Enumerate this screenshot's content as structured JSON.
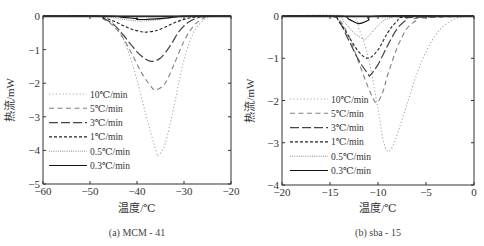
{
  "chart_data": [
    {
      "id": "a",
      "type": "line",
      "caption": "(a) MCM - 41",
      "xlabel": "温度/℃",
      "ylabel": "热流/mW",
      "xlim": [
        -60,
        -20
      ],
      "ylim": [
        -5,
        0
      ],
      "xticks": [
        -60,
        -50,
        -40,
        -30,
        -20
      ],
      "yticks": [
        0,
        -1,
        -2,
        -3,
        -4,
        -5
      ],
      "grid": false,
      "legend_position": "left-middle",
      "series": [
        {
          "name": "10℃/min",
          "style": "dotted-light",
          "peak_x": -35.5,
          "peak_y": -4.15,
          "onset_x": -47,
          "end_x": -24,
          "x": [
            -60,
            -48,
            -46,
            -44,
            -42,
            -40,
            -38,
            -36,
            -35.5,
            -34,
            -32,
            -30,
            -28,
            -26,
            -24,
            -20
          ],
          "y": [
            0,
            0,
            -0.1,
            -0.4,
            -1.0,
            -1.9,
            -3.0,
            -4.0,
            -4.15,
            -3.8,
            -2.6,
            -1.3,
            -0.5,
            -0.15,
            -0.02,
            0
          ]
        },
        {
          "name": "5℃/min",
          "style": "dashed",
          "peak_x": -36,
          "peak_y": -2.2,
          "onset_x": -48,
          "end_x": -25,
          "x": [
            -60,
            -49,
            -47,
            -45,
            -43,
            -41,
            -39,
            -37,
            -36,
            -34,
            -32,
            -30,
            -28,
            -26,
            -25,
            -20
          ],
          "y": [
            0,
            0,
            -0.1,
            -0.3,
            -0.65,
            -1.15,
            -1.7,
            -2.1,
            -2.2,
            -2.0,
            -1.4,
            -0.75,
            -0.3,
            -0.08,
            -0.02,
            0
          ]
        },
        {
          "name": "3℃/min",
          "style": "long-dash",
          "peak_x": -37,
          "peak_y": -1.35,
          "onset_x": -48,
          "end_x": -26,
          "x": [
            -60,
            -49,
            -47,
            -45,
            -43,
            -41,
            -39,
            -37,
            -35,
            -33,
            -31,
            -29,
            -27,
            -26,
            -20
          ],
          "y": [
            0,
            0,
            -0.08,
            -0.25,
            -0.55,
            -0.9,
            -1.2,
            -1.35,
            -1.25,
            -0.9,
            -0.45,
            -0.18,
            -0.05,
            -0.02,
            0
          ]
        },
        {
          "name": "1℃/min",
          "style": "short-dash",
          "peak_x": -38,
          "peak_y": -0.48,
          "onset_x": -49,
          "end_x": -26,
          "x": [
            -60,
            -49,
            -47,
            -45,
            -43,
            -41,
            -39,
            -38,
            -36,
            -34,
            -32,
            -30,
            -28,
            -26,
            -20
          ],
          "y": [
            0,
            0,
            -0.05,
            -0.15,
            -0.28,
            -0.4,
            -0.47,
            -0.48,
            -0.44,
            -0.33,
            -0.2,
            -0.1,
            -0.04,
            -0.01,
            0
          ]
        },
        {
          "name": "0.5℃/min",
          "style": "dotted",
          "peak_x": -39,
          "peak_y": -0.15,
          "onset_x": -48,
          "end_x": -28,
          "x": [
            -60,
            -48,
            -45,
            -42,
            -39,
            -36,
            -33,
            -30,
            -28,
            -20
          ],
          "y": [
            0,
            0,
            -0.05,
            -0.12,
            -0.15,
            -0.12,
            -0.06,
            -0.02,
            0,
            0
          ]
        },
        {
          "name": "0.3℃/min",
          "style": "solid",
          "peak_x": -39,
          "peak_y": -0.1,
          "onset_x": -46,
          "end_x": -30,
          "x": [
            -60,
            -46,
            -43,
            -40,
            -40,
            -38,
            -35,
            -32,
            -30,
            -20
          ],
          "y": [
            0,
            0,
            -0.04,
            -0.08,
            -0.1,
            -0.1,
            -0.08,
            -0.03,
            0,
            0
          ]
        }
      ]
    },
    {
      "id": "b",
      "type": "line",
      "caption": "(b) sba - 15",
      "xlabel": "温度/℃",
      "ylabel": "热流/mW",
      "xlim": [
        -20,
        0
      ],
      "ylim": [
        -4,
        0
      ],
      "xticks": [
        -20,
        -15,
        -10,
        -5,
        0
      ],
      "yticks": [
        0,
        -1,
        -2,
        -3,
        -4
      ],
      "grid": false,
      "legend_position": "left-lower",
      "series": [
        {
          "name": "10℃/min",
          "style": "dotted-light",
          "peak_x": -9,
          "peak_y": -3.2,
          "onset_x": -13,
          "end_x": -1,
          "x": [
            -20,
            -13,
            -12,
            -11,
            -10,
            -9.5,
            -9,
            -8.5,
            -8,
            -7,
            -6,
            -5,
            -4,
            -3,
            -2,
            -1,
            0
          ],
          "y": [
            0,
            0,
            -0.3,
            -1.0,
            -2.2,
            -2.9,
            -3.2,
            -3.1,
            -2.8,
            -2.1,
            -1.4,
            -0.85,
            -0.45,
            -0.2,
            -0.07,
            -0.01,
            0
          ]
        },
        {
          "name": "5℃/min",
          "style": "dashed",
          "peak_x": -10.2,
          "peak_y": -2.05,
          "onset_x": -15,
          "end_x": -5.8,
          "x": [
            -20,
            -15,
            -14,
            -13,
            -12,
            -11,
            -10.2,
            -9.5,
            -9,
            -8,
            -7,
            -6,
            -5.8,
            0
          ],
          "y": [
            0,
            0,
            -0.1,
            -0.5,
            -1.1,
            -1.7,
            -2.05,
            -1.8,
            -1.4,
            -0.75,
            -0.3,
            -0.1,
            -0.05,
            0
          ]
        },
        {
          "name": "3℃/min",
          "style": "long-dash",
          "peak_x": -10.8,
          "peak_y": -1.4,
          "onset_x": -15,
          "end_x": -6.5,
          "x": [
            -20,
            -15,
            -14,
            -13,
            -12,
            -11,
            -10.8,
            -10,
            -9,
            -8,
            -7,
            -6.5,
            0
          ],
          "y": [
            0,
            0,
            -0.15,
            -0.6,
            -1.05,
            -1.38,
            -1.4,
            -1.15,
            -0.7,
            -0.3,
            -0.08,
            -0.03,
            0
          ]
        },
        {
          "name": "1℃/min",
          "style": "short-dash",
          "peak_x": -11,
          "peak_y": -1.0,
          "onset_x": -15,
          "end_x": -7,
          "x": [
            -20,
            -15,
            -14,
            -13,
            -12,
            -11,
            -10,
            -9,
            -8,
            -7,
            0
          ],
          "y": [
            0,
            0,
            -0.15,
            -0.5,
            -0.85,
            -1.0,
            -0.8,
            -0.4,
            -0.12,
            -0.02,
            0
          ]
        },
        {
          "name": "0.5℃/min",
          "style": "dotted",
          "peak_x": -11.3,
          "peak_y": -0.55,
          "onset_x": -14.5,
          "end_x": -8,
          "x": [
            -20,
            -14.5,
            -13.5,
            -12.5,
            -11.5,
            -11.3,
            -10.5,
            -9.5,
            -8.5,
            -8,
            0
          ],
          "y": [
            0,
            0,
            -0.15,
            -0.4,
            -0.55,
            -0.55,
            -0.35,
            -0.12,
            -0.03,
            0,
            0
          ]
        },
        {
          "name": "0.3℃/min",
          "style": "solid",
          "peak_x": -12,
          "peak_y": -0.18,
          "onset_x": -14,
          "end_x": -10,
          "x": [
            -20,
            -14,
            -13,
            -12,
            -11,
            -10,
            0
          ],
          "y": [
            0,
            0,
            -0.08,
            -0.18,
            -0.1,
            0,
            0
          ]
        }
      ]
    }
  ]
}
